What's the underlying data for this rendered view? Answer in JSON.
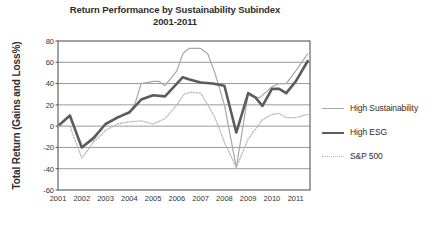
{
  "chart_data": {
    "type": "line",
    "title": "Return Performance by Sustainability Subindex\n2001-2011",
    "title_line1": "Return Performance by Sustainability Subindex",
    "title_line2": "2001-2011",
    "xlabel": "",
    "ylabel": "Total Return (Gains and Loss%)",
    "ylim": [
      -60,
      80
    ],
    "xlim": [
      2001,
      2011.6
    ],
    "yticks": [
      80,
      60,
      40,
      20,
      0,
      -20,
      -40,
      -60
    ],
    "ytick_labels": [
      "80",
      "60",
      "40",
      "20",
      "0",
      "-20",
      "-40",
      "-60"
    ],
    "categories": [
      "2001",
      "2002",
      "2003",
      "2004",
      "2005",
      "2006",
      "2007",
      "2008",
      "2009",
      "2010",
      "2011"
    ],
    "xticks": [
      2001,
      2002,
      2003,
      2004,
      2005,
      2006,
      2007,
      2008,
      2009,
      2010,
      2011
    ],
    "grid": "horizontal",
    "legend_position": "right",
    "colors": {
      "high_sustainability": "#a8a8a8",
      "high_esg": "#5c5c5c",
      "sp500": "#b9b9b9",
      "gridline": "#9a9a9a",
      "frame": "#555555",
      "text": "#2e2e2e"
    },
    "series": [
      {
        "name": "High Sustainability",
        "style": "solid-thin",
        "color": "#a8a8a8",
        "x": [
          2001.0,
          2001.5,
          2002.0,
          2002.5,
          2003.0,
          2003.5,
          2004.0,
          2004.25,
          2004.5,
          2005.0,
          2005.25,
          2005.5,
          2006.0,
          2006.25,
          2006.5,
          2007.0,
          2007.3,
          2007.6,
          2008.0,
          2008.5,
          2009.0,
          2009.25,
          2009.5,
          2010.0,
          2010.3,
          2010.6,
          2011.0,
          2011.5
        ],
        "values": [
          0,
          9,
          -20,
          -13,
          2,
          9,
          12,
          22,
          40,
          42,
          42,
          38,
          52,
          68,
          73,
          73,
          68,
          50,
          20,
          -39,
          30,
          27,
          27,
          37,
          40,
          40,
          52,
          68
        ]
      },
      {
        "name": "High ESG",
        "style": "solid-thick",
        "color": "#5c5c5c",
        "x": [
          2001.0,
          2001.5,
          2002.0,
          2002.5,
          2003.0,
          2003.5,
          2004.0,
          2004.5,
          2005.0,
          2005.5,
          2006.0,
          2006.25,
          2006.5,
          2007.0,
          2007.5,
          2008.0,
          2008.5,
          2009.0,
          2009.3,
          2009.6,
          2010.0,
          2010.3,
          2010.6,
          2011.0,
          2011.5
        ],
        "values": [
          0,
          10,
          -20,
          -11,
          2,
          8,
          13,
          25,
          29,
          28,
          40,
          46,
          44,
          41,
          40,
          38,
          -6,
          31,
          27,
          19,
          35,
          35,
          31,
          42,
          61
        ]
      },
      {
        "name": "S&P 500",
        "style": "dotted",
        "color": "#b9b9b9",
        "x": [
          2001.0,
          2001.5,
          2002.0,
          2002.5,
          2003.0,
          2003.5,
          2004.0,
          2004.5,
          2005.0,
          2005.5,
          2006.0,
          2006.3,
          2006.6,
          2007.0,
          2007.3,
          2007.6,
          2008.0,
          2008.5,
          2009.0,
          2009.3,
          2009.6,
          2010.0,
          2010.3,
          2010.6,
          2011.0,
          2011.5
        ],
        "values": [
          0,
          0,
          -30,
          -15,
          -4,
          2,
          4,
          5,
          2,
          7,
          20,
          30,
          32,
          31,
          20,
          8,
          -15,
          -39,
          -12,
          -3,
          6,
          11,
          12,
          8,
          8,
          11
        ]
      }
    ]
  },
  "legend": {
    "items": [
      {
        "label": "High Sustainability"
      },
      {
        "label": "High ESG"
      },
      {
        "label": "S&P 500"
      }
    ]
  }
}
